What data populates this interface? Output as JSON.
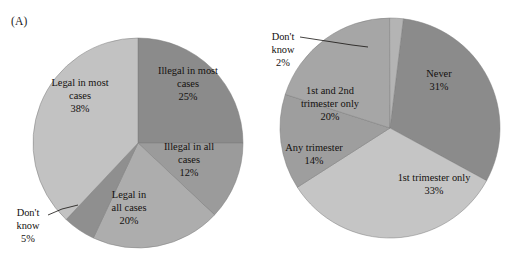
{
  "figure": {
    "width": 507,
    "height": 258,
    "background": "#ffffff"
  },
  "panels": [
    {
      "id": "A",
      "label": "(A)"
    },
    {
      "id": "B",
      "label": "(B)"
    }
  ],
  "chart_data": [
    {
      "type": "pie",
      "panel": "(A)",
      "title": "",
      "center": [
        138,
        143
      ],
      "radius": 105,
      "start_angle_deg": 0,
      "direction": "clockwise",
      "units": "percent",
      "legend": "none",
      "labels_position": "inside-with-leader-for-small-slice",
      "categories": [
        "Illegal in most cases",
        "Illegal in all cases",
        "Legal in all cases",
        "Don't know",
        "Legal in most cases"
      ],
      "values": [
        25,
        12,
        20,
        5,
        38
      ],
      "colors": [
        "#8b8b8b",
        "#9b9b9b",
        "#adadad",
        "#8f8f8f",
        "#c2c2c2"
      ],
      "slices": [
        {
          "label": "Illegal in most cases",
          "value": 25,
          "value_text": "25%",
          "color": "#8b8b8b",
          "label_lines": [
            "Illegal in most",
            "cases",
            "25%"
          ],
          "label_xy": [
            188,
            74
          ],
          "leader": false
        },
        {
          "label": "Illegal in all cases",
          "value": 12,
          "value_text": "12%",
          "color": "#9b9b9b",
          "label_lines": [
            "Illegal in all",
            "cases",
            "12%"
          ],
          "label_xy": [
            189,
            150
          ],
          "leader": false
        },
        {
          "label": "Legal in all cases",
          "value": 20,
          "value_text": "20%",
          "color": "#adadad",
          "label_lines": [
            "Legal in",
            "all cases",
            "20%"
          ],
          "label_xy": [
            129,
            198
          ],
          "leader": false
        },
        {
          "label": "Don't know",
          "value": 5,
          "value_text": "5%",
          "color": "#8f8f8f",
          "label_lines": [
            "Don't",
            "know",
            "5%"
          ],
          "label_xy": [
            28,
            216
          ],
          "leader": true,
          "leader_path": [
            [
              48,
              215
            ],
            [
              62,
              209
            ],
            [
              78,
              205
            ]
          ]
        },
        {
          "label": "Legal in most cases",
          "value": 38,
          "value_text": "38%",
          "color": "#c2c2c2",
          "label_lines": [
            "Legal in most",
            "cases",
            "38%"
          ],
          "label_xy": [
            80,
            86
          ],
          "leader": false
        }
      ]
    },
    {
      "type": "pie",
      "panel": "(B)",
      "title": "",
      "center": [
        390,
        128
      ],
      "radius": 110,
      "start_angle_deg": 7,
      "direction": "clockwise",
      "units": "percent",
      "legend": "none",
      "labels_position": "inside-with-leader-for-small-slice",
      "categories": [
        "Never",
        "1st trimester only",
        "Any trimester",
        "1st and 2nd trimester only",
        "Don't know"
      ],
      "values": [
        31,
        33,
        14,
        20,
        2
      ],
      "colors": [
        "#8b8b8b",
        "#c5c5c5",
        "#9e9e9e",
        "#a6a6a6",
        "#b4b4b4"
      ],
      "slices": [
        {
          "label": "Never",
          "value": 31,
          "value_text": "31%",
          "color": "#8b8b8b",
          "label_lines": [
            "Never",
            "31%"
          ],
          "label_xy": [
            439,
            77
          ],
          "leader": false
        },
        {
          "label": "1st trimester only",
          "value": 33,
          "value_text": "33%",
          "color": "#c5c5c5",
          "label_lines": [
            "1st trimester only",
            "33%"
          ],
          "label_xy": [
            434,
            181
          ],
          "leader": false
        },
        {
          "label": "Any trimester",
          "value": 14,
          "value_text": "14%",
          "color": "#9e9e9e",
          "label_lines": [
            "Any trimester",
            "14%"
          ],
          "label_xy": [
            314,
            151
          ],
          "leader": false
        },
        {
          "label": "1st and 2nd trimester only",
          "value": 20,
          "value_text": "20%",
          "color": "#a6a6a6",
          "label_lines": [
            "1st and 2nd",
            "trimester only",
            "20%"
          ],
          "label_xy": [
            330,
            94
          ],
          "leader": false
        },
        {
          "label": "Don't know",
          "value": 2,
          "value_text": "2%",
          "color": "#b4b4b4",
          "label_lines": [
            "Don't",
            "know",
            "2%"
          ],
          "label_xy": [
            283,
            40
          ],
          "leader": true,
          "leader_path": [
            [
              300,
              37
            ],
            [
              352,
              45
            ],
            [
              368,
              47
            ]
          ]
        }
      ]
    }
  ]
}
